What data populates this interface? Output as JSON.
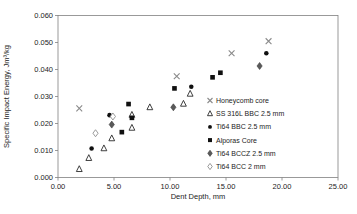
{
  "figure": {
    "background": "#ffffff"
  },
  "chart_data": {
    "type": "scatter",
    "title": "",
    "xlabel": "Dent Depth, mm",
    "ylabel": "Specific Impact Energy, Jm³/kg",
    "xlim": [
      0,
      25
    ],
    "ylim": [
      0,
      0.06
    ],
    "grid": false,
    "legend_position": "inside-right-bottom",
    "axis_color": "#808080",
    "text_color": "#1c1c1c",
    "x_tick_values": [
      0,
      5,
      10,
      15,
      20,
      25
    ],
    "x_tick_labels": [
      "0.00",
      "5.00",
      "10.00",
      "15.00",
      "20.00",
      "25.00"
    ],
    "y_tick_values": [
      0,
      0.01,
      0.02,
      0.03,
      0.04,
      0.05,
      0.06
    ],
    "y_tick_labels": [
      "0.000",
      "0.010",
      "0.020",
      "0.030",
      "0.040",
      "0.050",
      "0.060"
    ],
    "series": [
      {
        "name": "Honeycomb core",
        "marker": "x-cross",
        "color": "#8a8a8a",
        "points": [
          [
            1.9,
            0.0256
          ],
          [
            10.6,
            0.0375
          ],
          [
            15.5,
            0.046
          ],
          [
            18.8,
            0.0505
          ]
        ]
      },
      {
        "name": "SS 316L BBC 2.5 mm",
        "marker": "triangle-open",
        "color": "#2a2a2a",
        "points": [
          [
            1.9,
            0.0031
          ],
          [
            2.75,
            0.0072
          ],
          [
            4.1,
            0.0108
          ],
          [
            4.8,
            0.0145
          ],
          [
            6.6,
            0.0184
          ],
          [
            6.6,
            0.0232
          ],
          [
            8.2,
            0.026
          ],
          [
            11.2,
            0.0273
          ],
          [
            11.8,
            0.031
          ]
        ]
      },
      {
        "name": "Ti64 BBC 2.5 mm",
        "marker": "circle-filled",
        "color": "#101010",
        "points": [
          [
            3.0,
            0.0107
          ],
          [
            4.6,
            0.0231
          ],
          [
            11.9,
            0.0336
          ],
          [
            18.6,
            0.046
          ]
        ]
      },
      {
        "name": "Alporas Core",
        "marker": "square-filled",
        "color": "#101010",
        "points": [
          [
            5.7,
            0.0168
          ],
          [
            6.3,
            0.0272
          ],
          [
            6.6,
            0.0221
          ],
          [
            10.4,
            0.033
          ],
          [
            13.8,
            0.0371
          ],
          [
            14.5,
            0.0388
          ]
        ]
      },
      {
        "name": "Ti64 BCCZ 2.5 mm",
        "marker": "diamond-filled",
        "color": "#5a5a5a",
        "points": [
          [
            4.8,
            0.0196
          ],
          [
            10.3,
            0.026
          ],
          [
            18.0,
            0.0413
          ]
        ]
      },
      {
        "name": "Ti64 BCC 2 mm",
        "marker": "diamond-open",
        "color": "#8f8f8f",
        "points": [
          [
            3.35,
            0.0164
          ],
          [
            4.9,
            0.0226
          ]
        ]
      }
    ]
  }
}
